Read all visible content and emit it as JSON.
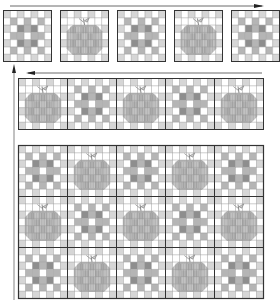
{
  "diagram": {
    "title": "",
    "colors": {
      "outline": "#333333",
      "grid_line": "#9a9a9a",
      "light": "#d6d6d6",
      "medium": "#b5b5b5",
      "dark": "#8e8e8e",
      "background": "#ffffff"
    },
    "step1_row": {
      "label": "Loose blocks",
      "blocks": [
        "checker",
        "apple",
        "checker",
        "apple",
        "checker"
      ]
    },
    "step2_row": {
      "label": "Joined row",
      "blocks": [
        "apple",
        "checker",
        "apple",
        "checker",
        "apple"
      ]
    },
    "step3_grid": {
      "label": "Assembled quilt",
      "rows": [
        [
          "checker",
          "apple",
          "checker",
          "apple",
          "checker"
        ],
        [
          "apple",
          "checker",
          "apple",
          "checker",
          "apple"
        ],
        [
          "checker",
          "apple",
          "checker",
          "apple",
          "checker"
        ]
      ]
    },
    "arrows": [
      {
        "name": "top-arrow",
        "direction": "right"
      },
      {
        "name": "left-up-arrow",
        "direction": "up"
      },
      {
        "name": "row2-arrow",
        "direction": "left"
      }
    ]
  }
}
